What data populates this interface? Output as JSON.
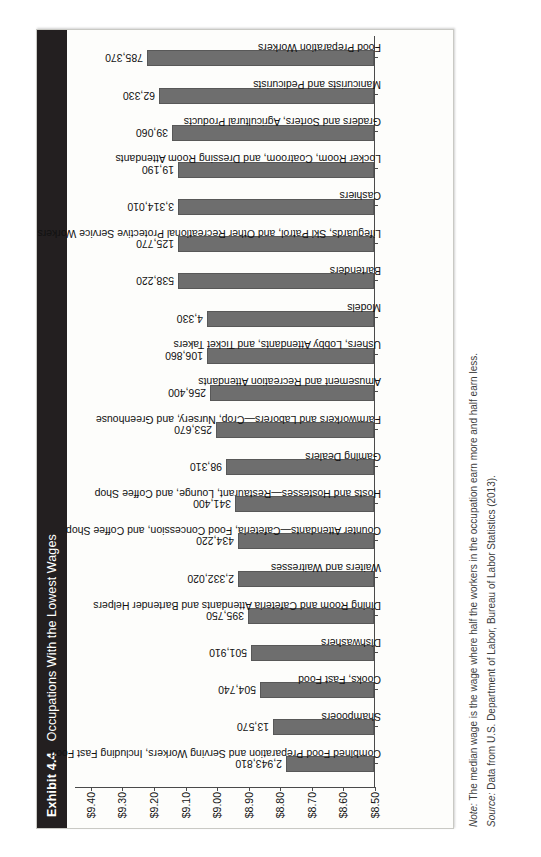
{
  "exhibit": {
    "number": "Exhibit 4.4",
    "title": "Occupations With the Lowest Wages"
  },
  "note": {
    "lead": "Note:",
    "text": " The median wage is the wage where half the workers in the occupation earn more and half earn less."
  },
  "source": {
    "lead": "Source:",
    "text": " Data from U.S. Department of Labor, Bureau of Labor Statistics (2013)."
  },
  "colors": {
    "bar_fill": "#6e6e6e",
    "bar_stroke": "#585858",
    "header_bg": "#231f20",
    "header_text": "#ffffff",
    "card_bg": "#fdfdfb",
    "axis": "#4a4a4a"
  },
  "chart_data": {
    "type": "bar",
    "title": "Occupations With the Lowest Wages",
    "xlabel": "",
    "ylabel": "",
    "ylim": [
      8.5,
      9.45
    ],
    "grid": false,
    "legend": "none",
    "orientation": "vertical-bars-on-rotated-page",
    "ytick_labels": [
      "$8.50",
      "$8.60",
      "$8.70",
      "$8.80",
      "$8.90",
      "$9.00",
      "$9.10",
      "$9.20",
      "$9.30",
      "$9.40"
    ],
    "ytick_values": [
      8.5,
      8.6,
      8.7,
      8.8,
      8.9,
      9.0,
      9.1,
      9.2,
      9.3,
      9.4
    ],
    "categories": [
      "Combined Food Preparation and Serving Workers, Including Fast Food",
      "Shampooers",
      "Cooks, Fast Food",
      "Dishwashers",
      "Dining Room and Cafeteria Attendants and Bartender Helpers",
      "Waiters and Waitresses",
      "Counter Attendants—Cafeteria, Food Concession, and Coffee Shop",
      "Hosts and Hostesses—Restaurant, Lounge, and Coffee Shop",
      "Gaming Dealers",
      "Farmworkers and Laborers—Crop, Nursery, and Greenhouse",
      "Amusement and Recreation Attendants",
      "Ushers, Lobby Attendants, and Ticket Takers",
      "Models",
      "Bartenders",
      "Lifeguards, Ski Patrol, and Other Recreational Protective Service Workers",
      "Cashiers",
      "Locker Room, Coatroom, and Dressing Room Attendants",
      "Graders and Sorters, Agricultural Products",
      "Manicurists and Pedicurists",
      "Food Preparation Workers"
    ],
    "values": [
      8.78,
      8.82,
      8.86,
      8.89,
      8.9,
      8.93,
      8.93,
      8.94,
      8.97,
      9.0,
      9.02,
      9.03,
      9.03,
      9.12,
      9.12,
      9.12,
      9.12,
      9.14,
      9.18,
      9.22
    ],
    "data_labels": [
      "2,943,810",
      "13,570",
      "504,740",
      "501,910",
      "395,750",
      "2,332,020",
      "434,220",
      "341,400",
      "98,310",
      "253,670",
      "256,400",
      "106,860",
      "4,330",
      "538,220",
      "125,770",
      "3,314,010",
      "19,190",
      "39,060",
      "62,330",
      "785,370"
    ],
    "data_label_meaning": "number of workers employed in the occupation"
  }
}
